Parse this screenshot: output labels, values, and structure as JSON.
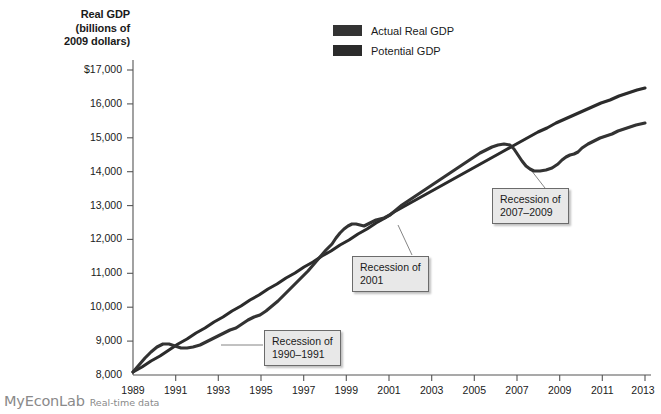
{
  "figure": {
    "y_axis_title_lines": [
      "Real GDP",
      "(billions of",
      "2009 dollars)"
    ],
    "footer_brand": "MyEconLab",
    "footer_sub": "Real-time data"
  },
  "legend": {
    "items": [
      {
        "label": "Actual Real GDP",
        "color": "#333333"
      },
      {
        "label": "Potential GDP",
        "color": "#2b2b2b"
      }
    ]
  },
  "callouts": [
    {
      "name": "recession-1990-1991",
      "lines": [
        "Recession of",
        "1990–1991"
      ]
    },
    {
      "name": "recession-2001",
      "lines": [
        "Recession of",
        "2001"
      ]
    },
    {
      "name": "recession-2007-2009",
      "lines": [
        "Recession of",
        "2007–2009"
      ]
    }
  ],
  "chart_data": {
    "type": "line",
    "title": "",
    "xlabel": "",
    "ylabel": "Real GDP (billions of 2009 dollars)",
    "xlim": [
      1989,
      2013
    ],
    "ylim": [
      8000,
      17000
    ],
    "ytick_labels": [
      "$17,000",
      "16,000",
      "15,000",
      "14,000",
      "13,000",
      "12,000",
      "11,000",
      "10,000",
      "9,000",
      "8,000"
    ],
    "yticks": [
      17000,
      16000,
      15000,
      14000,
      13000,
      12000,
      11000,
      10000,
      9000,
      8000
    ],
    "xticks": [
      1989,
      1991,
      1993,
      1995,
      1997,
      1999,
      2001,
      2003,
      2005,
      2007,
      2009,
      2011,
      2013
    ],
    "grid": false,
    "legend_position": "top-center",
    "annotations": [
      {
        "text": "Recession of 1990–1991",
        "points_to_year": 1991.0
      },
      {
        "text": "Recession of 2001",
        "points_to_year": 2002.0
      },
      {
        "text": "Recession of 2007–2009",
        "points_to_year": 2009.0
      }
    ],
    "x": [
      1989,
      1989.5,
      1990,
      1990.5,
      1991,
      1991.5,
      1992,
      1992.5,
      1993,
      1993.5,
      1994,
      1994.5,
      1995,
      1995.5,
      1996,
      1996.5,
      1997,
      1997.5,
      1998,
      1998.5,
      1999,
      1999.5,
      2000,
      2000.5,
      2001,
      2001.5,
      2002,
      2002.5,
      2003,
      2003.5,
      2004,
      2004.5,
      2005,
      2005.5,
      2006,
      2006.5,
      2007,
      2007.5,
      2008,
      2008.5,
      2009,
      2009.5,
      2010,
      2010.5,
      2011,
      2011.5,
      2012,
      2012.5,
      2013
    ],
    "series": [
      {
        "name": "Actual Real GDP",
        "color": "#333333",
        "values": [
          8600,
          8720,
          8810,
          8800,
          8740,
          8790,
          8900,
          9030,
          9100,
          9200,
          9340,
          9470,
          9520,
          9600,
          9750,
          9920,
          10120,
          10330,
          10560,
          10790,
          11030,
          11300,
          11520,
          11600,
          11620,
          11650,
          11760,
          11860,
          11950,
          12200,
          12380,
          12510,
          12670,
          12820,
          12970,
          13070,
          13200,
          13300,
          13250,
          13100,
          12800,
          12830,
          12980,
          13120,
          13200,
          13320,
          13500,
          13620,
          13750
        ]
      },
      {
        "name": "Potential GDP",
        "color": "#2b2b2b",
        "values": [
          8600,
          8700,
          8800,
          8900,
          9000,
          9100,
          9200,
          9310,
          9410,
          9520,
          9630,
          9740,
          9860,
          9980,
          10100,
          10230,
          10360,
          10490,
          10630,
          10770,
          10920,
          11070,
          11220,
          11370,
          11520,
          11670,
          11820,
          11960,
          12100,
          12250,
          12400,
          12540,
          12680,
          12820,
          12960,
          13090,
          13220,
          13340,
          13460,
          13580,
          13700,
          13810,
          13920,
          14030,
          14140,
          14250,
          14360,
          14460,
          14560
        ]
      }
    ],
    "_note_plot_uses_normalized_values": "Actual pixel geometry derived from screenshot trace; series values above are the read-off GDP levels in billions of 2009 dollars."
  },
  "plot_geometry": {
    "left": 133,
    "right": 645,
    "top": 70,
    "bottom": 375,
    "y_top_value": 17000,
    "y_bottom_value": 8000,
    "x_left_value": 1989,
    "x_right_value": 2013,
    "actual_path": "M133,372 L139,365 L145,358 L151,352 L157,347 L163,344 L169,344 L175,346 L181,348 L187,348 L193,347 L200,345 L206,342 L212,339 L218,336 L224,333 L230,330 L236,328 L242,324 L248,320 L254,317 L260,315 L266,311 L272,306 L278,301 L284,295 L290,289 L296,283 L302,277 L308,271 L314,264 L320,257 L326,250 L332,244 L336,238 L340,233 L344,229 L348,226 L352,224 L356,224 L360,225 L364,226 L368,224 L372,222 L376,220 L380,219 L384,218 L390,215 L396,210 L402,205 L408,201 L414,197 L420,193 L426,189 L432,185 L438,181 L444,177 L450,173 L456,169 L462,165 L468,161 L474,157 L480,153 L486,150 L492,147 L498,145 L504,144 L510,145 L514,149 L518,155 L522,161 L526,166 L530,169 L534,171 L540,171 L546,170 L552,168 L558,164 L562,160 L566,157 L570,155 L574,154 L578,152 L582,148 L588,144 L594,141 L600,138 L606,136 L612,134 L618,131 L624,129 L630,127 L636,125 L645,123",
    "potential_path": "M133,372 L142,367 L151,361 L160,356 L169,350 L178,344 L187,339 L196,333 L205,328 L214,322 L223,317 L232,311 L241,306 L250,300 L259,295 L268,289 L277,284 L286,278 L295,273 L304,267 L313,262 L322,256 L331,251 L340,245 L349,240 L358,234 L367,229 L376,223 L385,218 L394,212 L403,207 L412,202 L421,197 L430,192 L439,187 L448,182 L457,177 L466,172 L475,167 L484,162 L493,157 L502,152 L511,147 L520,142 L529,137 L538,132 L547,128 L556,123 L565,119 L574,115 L583,111 L592,107 L601,103 L610,100 L619,96 L628,93 L637,90 L645,88"
  },
  "y_tick_positions": [
    {
      "label": "$17,000",
      "y": 70
    },
    {
      "label": "16,000",
      "y": 103.9
    },
    {
      "label": "15,000",
      "y": 137.8
    },
    {
      "label": "14,000",
      "y": 171.7
    },
    {
      "label": "13,000",
      "y": 205.6
    },
    {
      "label": "12,000",
      "y": 239.4
    },
    {
      "label": "11,000",
      "y": 273.3
    },
    {
      "label": "10,000",
      "y": 307.2
    },
    {
      "label": "9,000",
      "y": 341.1
    },
    {
      "label": "8,000",
      "y": 375
    }
  ],
  "x_tick_positions": [
    {
      "label": "1989",
      "x": 133
    },
    {
      "label": "1991",
      "x": 175.7
    },
    {
      "label": "1993",
      "x": 218.3
    },
    {
      "label": "1995",
      "x": 261
    },
    {
      "label": "1997",
      "x": 303.7
    },
    {
      "label": "1999",
      "x": 346.3
    },
    {
      "label": "2001",
      "x": 389
    },
    {
      "label": "2003",
      "x": 431.7
    },
    {
      "label": "2005",
      "x": 474.3
    },
    {
      "label": "2007",
      "x": 517
    },
    {
      "label": "2009",
      "x": 559.7
    },
    {
      "label": "2011",
      "x": 602.3
    },
    {
      "label": "2013",
      "x": 645
    }
  ]
}
